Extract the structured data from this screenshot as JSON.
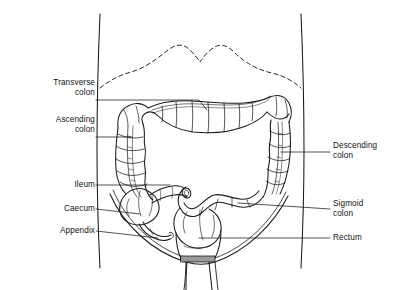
{
  "figure": {
    "background_color": "#ffffff",
    "line_color": "#1a1a1a",
    "labels_left": [
      {
        "id": "transverse",
        "text": "Transverse\ncolon",
        "leader_y": 100
      },
      {
        "id": "ascending",
        "text": "Ascending\ncolon",
        "leader_y": 137
      },
      {
        "id": "ileum",
        "text": "Ileum",
        "leader_y": 185
      },
      {
        "id": "caecum",
        "text": "Caecum",
        "leader_y": 209
      },
      {
        "id": "appendix",
        "text": "Appendix",
        "leader_y": 231
      }
    ],
    "labels_right": [
      {
        "id": "descending",
        "text": "Descending\ncolon",
        "leader_y": 152
      },
      {
        "id": "sigmoid",
        "text": "Sigmoid\ncolon",
        "leader_y": 209
      },
      {
        "id": "rectum",
        "text": "Rectum",
        "leader_y": 238
      }
    ],
    "parts": [
      "diaphragm-outline",
      "torso-outline",
      "pelvic-brim",
      "caecum",
      "appendix",
      "ileum",
      "ascending-colon",
      "transverse-colon",
      "descending-colon",
      "sigmoid-colon",
      "rectum",
      "anal-canal"
    ]
  }
}
